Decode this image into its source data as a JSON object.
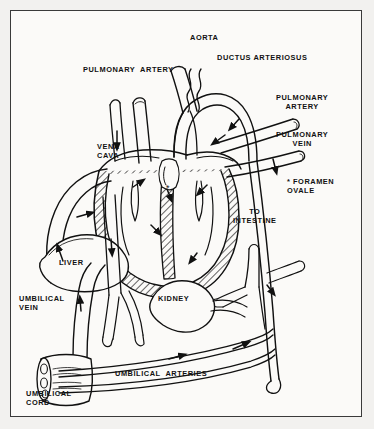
{
  "figure": {
    "background_color": "#f2f1ef",
    "page_color": "#fbfaf8",
    "ink_color": "#111111",
    "border_color": "#3a3a3a"
  },
  "labels": {
    "aorta": "AORTA",
    "ductus_arteriosus": "DUCTUS ARTERIOSUS",
    "pulmonary_artery_left": "PULMONARY  ARTERY",
    "pulmonary_artery_right": "PULMONARY\nARTERY",
    "pulmonary_vein": "PULMONARY\nVEIN",
    "vena_cava": "VENA\nCAVA",
    "foramen_ovale": "* FORAMEN\nOVALE",
    "to_intestine": "TO\nINTESTINE",
    "liver": "LIVER",
    "kidney": "KIDNEY",
    "umbilical_vein": "UMBILICAL\nVEIN",
    "umbilical_cord": "UMBILICAL\nCORD",
    "umbilical_arteries": "UMBILICAL  ARTERIES"
  },
  "structures": {
    "heart": "heart-cross-section",
    "liver_organ": "liver-outline",
    "kidney_organ": "kidney-outline",
    "cord": "umbilical-cord-cut-end",
    "septum_marker": "*"
  }
}
